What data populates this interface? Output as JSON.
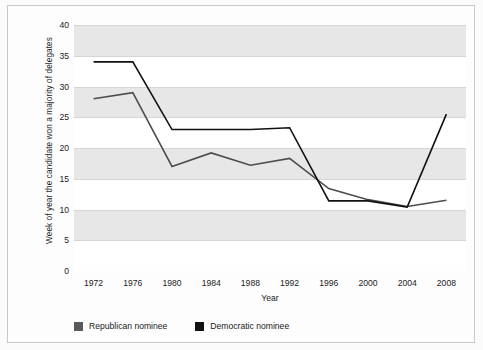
{
  "chart_data": {
    "type": "line",
    "title": "",
    "xlabel": "Year",
    "ylabel": "Week of year the candidate won a majority of delegates",
    "x": [
      1972,
      1976,
      1980,
      1984,
      1988,
      1992,
      1996,
      2000,
      2004,
      2008
    ],
    "xticklabels": [
      "1972",
      "1976",
      "1980",
      "1984",
      "1988",
      "1992",
      "1996",
      "2000",
      "2004",
      "2008"
    ],
    "yticks": [
      0,
      5,
      10,
      15,
      20,
      25,
      30,
      35,
      40
    ],
    "yticklabels": [
      "0",
      "5",
      "10",
      "15",
      "20",
      "25",
      "30",
      "35",
      "40"
    ],
    "xlim": [
      1970,
      2010
    ],
    "ylim": [
      0,
      40
    ],
    "grid": true,
    "legend_position": "below",
    "series": [
      {
        "name": "Republican nominee",
        "color": "#4d4d4d",
        "values": [
          28.0,
          29.0,
          17.0,
          19.2,
          17.2,
          18.3,
          13.4,
          11.6,
          10.5,
          11.5
        ]
      },
      {
        "name": "Democratic nominee",
        "color": "#111111",
        "values": [
          34.0,
          34.0,
          23.0,
          23.0,
          23.0,
          23.3,
          11.4,
          11.4,
          10.4,
          25.5
        ]
      }
    ]
  },
  "legend": {
    "entries": [
      {
        "label": "Republican nominee",
        "color": "#5a5a5a"
      },
      {
        "label": "Democratic nominee",
        "color": "#111111"
      }
    ]
  }
}
